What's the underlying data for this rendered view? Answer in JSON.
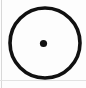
{
  "figure": {
    "name": "circle-with-center-point",
    "canvas": {
      "width": 86,
      "height": 88,
      "background_color": "#fdfdfd"
    },
    "shapes": {
      "outer_circle": {
        "label": "circle-outline",
        "center_x": 45,
        "center_y": 43,
        "radius": 35,
        "stroke_color": "#111111",
        "stroke_width": 3.6,
        "fill": "none"
      },
      "center_dot": {
        "label": "center-point",
        "center_x": 43.5,
        "center_y": 43.5,
        "radius": 3.6,
        "fill_color": "#111111"
      }
    },
    "rules": {
      "left_edge": {
        "label": "left-edge-rule",
        "color": "#d8d8d8",
        "x": 1,
        "thickness": 1
      },
      "bottom_edge": {
        "label": "bottom-edge-rule",
        "color": "#e2e2e2",
        "y_from_bottom": 7,
        "thickness": 1
      }
    }
  }
}
